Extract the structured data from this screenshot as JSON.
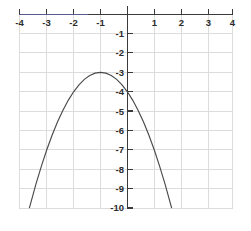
{
  "chart_data": {
    "type": "line",
    "title": "",
    "subtitle": "",
    "xlabel": "",
    "ylabel": "",
    "xlim": [
      -4,
      4
    ],
    "ylim": [
      -10,
      0.65
    ],
    "grid": true,
    "legend": "none",
    "x_ticks": [
      -4,
      -3,
      -2,
      -1,
      1,
      2,
      3,
      4
    ],
    "x_tick_labels": [
      "-4",
      "-3",
      "-2",
      "-1",
      "1",
      "2",
      "3",
      "4"
    ],
    "y_ticks": [
      -1,
      -2,
      -3,
      -4,
      -5,
      -6,
      -7,
      -8,
      -9,
      -10
    ],
    "y_tick_labels": [
      "-1",
      "-2",
      "-3",
      "-4",
      "-5",
      "-6",
      "-7",
      "-8",
      "-9",
      "-10"
    ],
    "series": [
      {
        "name": "parabola",
        "equation": "y = -(x + 1)^2 - 3",
        "vertex": [
          -1,
          -3
        ],
        "y_intercept": [
          0,
          -4
        ],
        "opens": "down",
        "color": "#4a4a4a",
        "x": [
          -3.646,
          -3.4,
          -3.2,
          -3.0,
          -2.8,
          -2.6,
          -2.4,
          -2.2,
          -2.0,
          -1.8,
          -1.6,
          -1.4,
          -1.2,
          -1.0,
          -0.8,
          -0.6,
          -0.4,
          -0.2,
          0.0,
          0.2,
          0.4,
          0.6,
          0.8,
          1.0,
          1.2,
          1.4,
          1.646
        ],
        "values": [
          -10.0,
          -8.76,
          -7.84,
          -7.0,
          -6.24,
          -5.56,
          -4.96,
          -4.44,
          -4.0,
          -3.64,
          -3.36,
          -3.16,
          -3.04,
          -3.0,
          -3.04,
          -3.16,
          -3.36,
          -3.64,
          -4.0,
          -4.44,
          -4.96,
          -5.56,
          -6.24,
          -7.0,
          -7.84,
          -8.76,
          -10.0
        ]
      }
    ],
    "axis_colors": {
      "axis": "#3a3a3a",
      "grid": "#dcdcdc",
      "curve": "#4a4a4a",
      "tick_text": "#2b2b2b",
      "background": "#ffffff"
    }
  }
}
